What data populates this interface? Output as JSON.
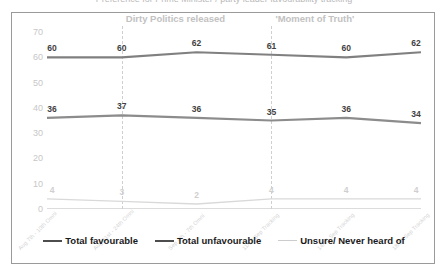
{
  "cutoff_title": "Preference for Prime Minister / party leader favourability tracking",
  "chart_data": {
    "type": "line",
    "title": "",
    "xlabel": "",
    "ylabel": "",
    "ylim": [
      0,
      70
    ],
    "y_ticks": [
      70,
      60,
      50,
      40,
      30,
      20,
      10,
      0
    ],
    "grid": false,
    "legend_position": "bottom",
    "categories": [
      "Aug 7th - 10th Omni",
      "Aug 21st - 24th Omni",
      "Sep 4th - 7th Omni",
      "11/13 Sep Tracking",
      "14/15 Sep Tracking",
      "18/19 Sep Tracking"
    ],
    "series": [
      {
        "name": "Total favourable",
        "color": "#808080",
        "values": [
          60,
          60,
          62,
          61,
          60,
          62
        ]
      },
      {
        "name": "Total unfavourable",
        "color": "#8c8c8c",
        "values": [
          36,
          37,
          36,
          35,
          36,
          34
        ]
      },
      {
        "name": "Unsure/ Never heard of",
        "color": "#d9d9d9",
        "values": [
          4,
          3,
          2,
          4,
          4,
          4
        ]
      }
    ],
    "annotations": [
      {
        "label": "Dirty Politics released",
        "italic_part": "Dirty Politics",
        "at_category_index": 1,
        "style": "dashed-vertical"
      },
      {
        "label": "'Moment of Truth'",
        "italic_part": "",
        "at_category_index": 3,
        "style": "dashed-vertical"
      }
    ]
  },
  "legend": {
    "entries": [
      {
        "label": "Total favourable",
        "color": "#4d4d4d",
        "thickness": "2.5px"
      },
      {
        "label": "Total unfavourable",
        "color": "#4d4d4d",
        "thickness": "2.5px"
      },
      {
        "label": "Unsure/ Never heard of",
        "color": "#cccccc",
        "thickness": "1.5px"
      }
    ]
  }
}
